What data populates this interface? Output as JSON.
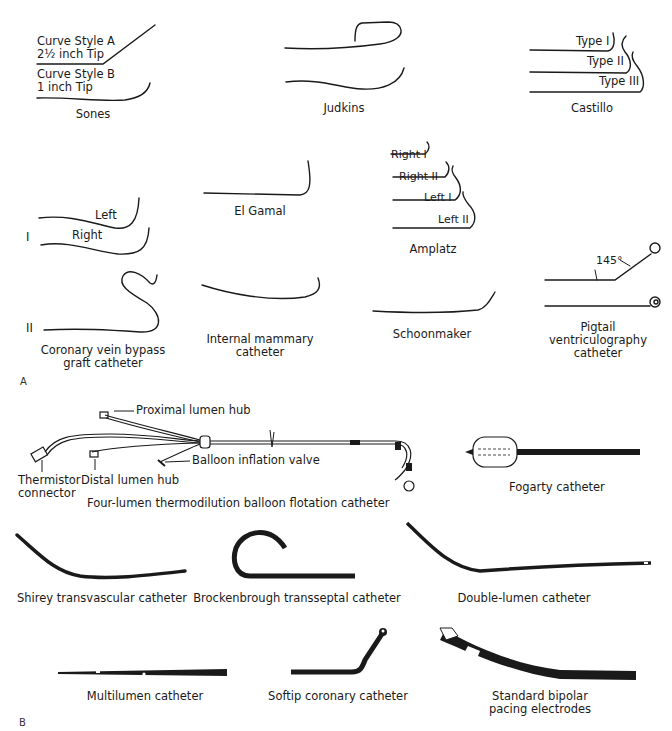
{
  "figure": {
    "panel_a": {
      "label": "A",
      "sones": {
        "title": "Sones",
        "curve_a_line1": "Curve Style A",
        "curve_a_line2": "2½ inch Tip",
        "curve_b_line1": "Curve Style B",
        "curve_b_line2": "1 inch Tip"
      },
      "judkins": {
        "title": "Judkins"
      },
      "castillo": {
        "title": "Castillo",
        "types": [
          "Type I",
          "Type II",
          "Type III"
        ]
      },
      "row_i_label": "I",
      "left_right": {
        "left": "Left",
        "right": "Right"
      },
      "el_gamal": {
        "title": "El Gamal"
      },
      "amplatz": {
        "title": "Amplatz",
        "types": [
          "Right I",
          "Right II",
          "Left I",
          "Left II"
        ]
      },
      "pigtail": {
        "angle": "145°",
        "title_line1": "Pigtail",
        "title_line2": "ventriculography",
        "title_line3": "catheter"
      },
      "row_ii_label": "II",
      "coronary_vein": {
        "line1": "Coronary vein bypass",
        "line2": "graft catheter"
      },
      "internal_mammary": {
        "line1": "Internal mammary",
        "line2": "catheter"
      },
      "schoonmaker": {
        "title": "Schoonmaker"
      }
    },
    "panel_b": {
      "label": "B",
      "four_lumen": {
        "title": "Four-lumen thermodilution balloon flotation catheter",
        "proximal_hub": "Proximal lumen hub",
        "balloon_valve": "Balloon inflation valve",
        "distal_hub": "Distal lumen hub",
        "thermistor_line1": "Thermistor",
        "thermistor_line2": "connector"
      },
      "fogarty": {
        "title": "Fogarty catheter"
      },
      "shirey": {
        "title": "Shirey transvascular catheter"
      },
      "brockenbrough": {
        "title": "Brockenbrough transseptal catheter"
      },
      "double_lumen": {
        "title": "Double-lumen catheter"
      },
      "multilumen": {
        "title": "Multilumen catheter"
      },
      "softip": {
        "title": "Softip coronary catheter"
      },
      "bipolar": {
        "title": "Standard bipolar pacing electrodes"
      }
    }
  }
}
